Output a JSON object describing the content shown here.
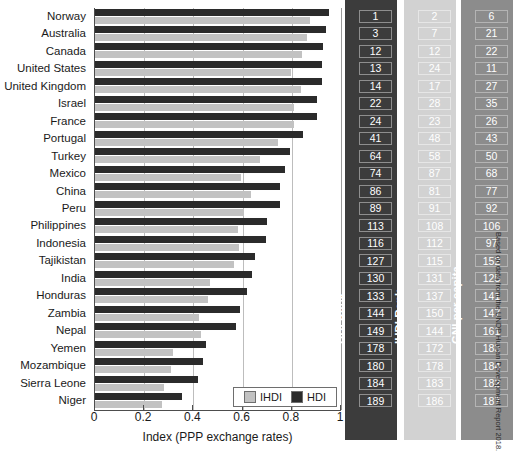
{
  "figure": {
    "title_cutoff": "",
    "source_note": "Based on data from the UNDP Human Development Report 2018.",
    "legend": {
      "ihdi_label": "IHDI",
      "hdi_label": "HDI"
    },
    "columns": {
      "hdi_rank_header": "HDI Rank",
      "ihdi_rank_header": "IHDI Rank",
      "gni_header": "GNI per capita"
    },
    "colors": {
      "hdi_bar": "#2b2b2b",
      "ihdi_bar": "#c2c2c2",
      "hdi_col_bg": "#3c3c3c",
      "ihdi_col_bg": "#d2d2d2",
      "gni_col_bg": "#8c8c8c"
    }
  },
  "chart_data": {
    "type": "bar",
    "orientation": "horizontal",
    "title": "",
    "xlabel": "Index (PPP exchange rates)",
    "ylabel": "",
    "xlim": [
      0,
      1
    ],
    "xticks": [
      0,
      0.2,
      0.4,
      0.6,
      0.8,
      1
    ],
    "xticklabels": [
      "0",
      "0.2",
      "0.4",
      "0.6",
      "0.8",
      "1"
    ],
    "grid": true,
    "legend_position": "lower-right-inside",
    "categories": [
      "Norway",
      "Australia",
      "Canada",
      "United States",
      "United Kingdom",
      "Israel",
      "France",
      "Portugal",
      "Turkey",
      "Mexico",
      "China",
      "Peru",
      "Philippines",
      "Indonesia",
      "Tajikistan",
      "India",
      "Honduras",
      "Zambia",
      "Nepal",
      "Yemen",
      "Mozambique",
      "Sierra Leone",
      "Niger"
    ],
    "series": [
      {
        "name": "HDI",
        "color": "#2b2b2b",
        "values": [
          0.953,
          0.939,
          0.926,
          0.924,
          0.922,
          0.903,
          0.901,
          0.847,
          0.791,
          0.774,
          0.752,
          0.75,
          0.699,
          0.694,
          0.65,
          0.64,
          0.617,
          0.588,
          0.574,
          0.452,
          0.437,
          0.419,
          0.354
        ]
      },
      {
        "name": "IHDI",
        "color": "#c2c2c2",
        "values": [
          0.876,
          0.862,
          0.841,
          0.797,
          0.836,
          0.809,
          0.808,
          0.742,
          0.669,
          0.595,
          0.636,
          0.606,
          0.582,
          0.584,
          0.567,
          0.468,
          0.459,
          0.424,
          0.43,
          0.316,
          0.309,
          0.282,
          0.272
        ]
      }
    ],
    "rank_columns": [
      {
        "key": "hdi_rank",
        "header": "HDI Rank",
        "values": [
          1,
          3,
          12,
          13,
          14,
          22,
          24,
          41,
          64,
          74,
          86,
          89,
          113,
          116,
          127,
          130,
          133,
          144,
          149,
          178,
          180,
          184,
          189
        ]
      },
      {
        "key": "ihdi_rank",
        "header": "IHDI Rank",
        "values": [
          2,
          7,
          12,
          24,
          17,
          28,
          23,
          48,
          58,
          87,
          81,
          91,
          108,
          112,
          115,
          131,
          137,
          150,
          144,
          172,
          178,
          183,
          186
        ]
      },
      {
        "key": "gni_per_capita",
        "header": "GNI per capita",
        "values": [
          6,
          21,
          22,
          11,
          27,
          35,
          26,
          43,
          50,
          68,
          77,
          92,
          106,
          97,
          152,
          125,
          141,
          147,
          161,
          183,
          184,
          182,
          187
        ]
      }
    ]
  }
}
